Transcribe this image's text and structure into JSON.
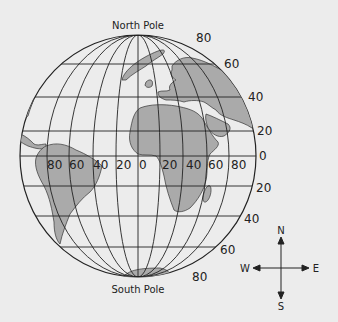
{
  "title_top": "North Pole",
  "title_bottom": "South Pole",
  "latitude_labels": {
    "n80": "80",
    "n60": "60",
    "n40": "40",
    "n20": "20",
    "eq": "0",
    "s20": "20",
    "s40": "40",
    "s60": "60",
    "s80": "80"
  },
  "longitude_labels": {
    "w80": "80",
    "w60": "60",
    "w40": "40",
    "w20": "20",
    "zero": "0",
    "e20": "20",
    "e40": "40",
    "e60": "60",
    "e80": "80"
  },
  "compass": {
    "n": "N",
    "s": "S",
    "e": "E",
    "w": "W"
  },
  "colors": {
    "land": "#aaaaaa",
    "ocean": "#ececec",
    "lines": "#222222",
    "background": "#ececec"
  }
}
